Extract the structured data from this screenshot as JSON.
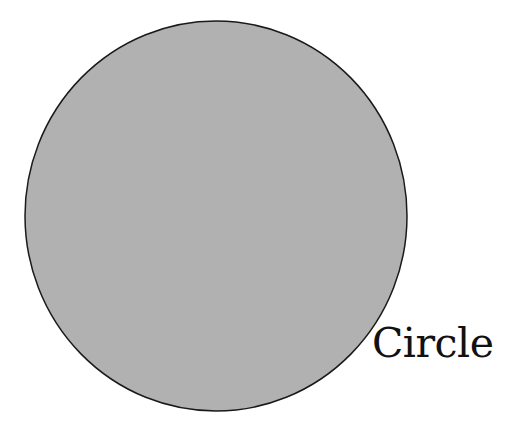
{
  "diagram": {
    "shape": {
      "type": "circle",
      "cx": 216,
      "cy": 216,
      "rx": 191,
      "ry": 195,
      "fill": "#b1b1b1",
      "stroke": "#1a1a1a"
    },
    "label": "Circle"
  }
}
